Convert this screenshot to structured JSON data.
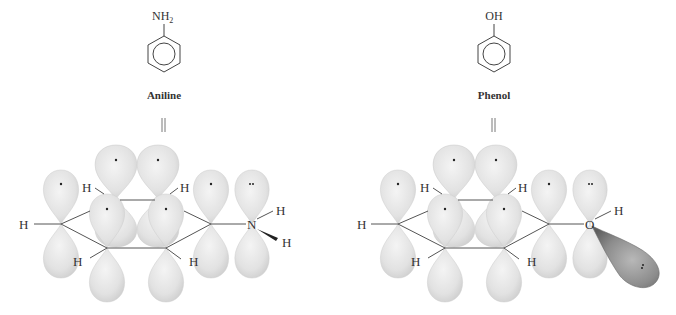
{
  "panels": [
    {
      "id": "aniline",
      "name": "Aniline",
      "substituent": "NH",
      "substituent_subscript": "2",
      "equivalence_symbol": "‖",
      "heteroatom": "N",
      "hydrogen_label": "H",
      "lone_pair_dots": "··",
      "single_dot": "·"
    },
    {
      "id": "phenol",
      "name": "Phenol",
      "substituent": "OH",
      "substituent_subscript": "",
      "equivalence_symbol": "‖",
      "heteroatom": "O",
      "hydrogen_label": "H",
      "lone_pair_dots": "··",
      "single_dot": "·"
    }
  ],
  "colors": {
    "orbital_fill": "#e6e6e6",
    "orbital_edge": "#c8c8c8",
    "sp2_orbital_fill": "#8a8a8a",
    "bond_line": "#555555",
    "text": "#333333"
  }
}
